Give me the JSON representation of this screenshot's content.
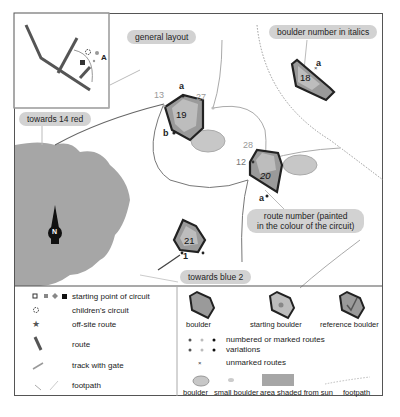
{
  "map": {
    "callouts": {
      "general_layout": "general layout",
      "boulder_number_italics": "boulder number in italics",
      "towards_14_red": "towards 14 red",
      "route_number": "route number (painted",
      "route_number_line2": "in the colour of the circuit)",
      "towards_blue_2": "towards blue 2"
    },
    "inset": {
      "letter": "A"
    },
    "route_numbers": {
      "r13": "13",
      "r27": "27",
      "r28": "28",
      "r12": "12",
      "r1": "1"
    },
    "route_letters": {
      "a19": "a",
      "b19": "b",
      "a20": "a",
      "a18": "a"
    },
    "boulders": [
      {
        "number": "19"
      },
      {
        "number": "20"
      },
      {
        "number": "21"
      },
      {
        "number": "18"
      }
    ],
    "north": "N",
    "colors": {
      "shade": "#a6a6a6",
      "boulder_dark": "#555555",
      "boulder_mid": "#9a9a9a",
      "path": "#888888",
      "footpath": "#aaaaaa"
    }
  },
  "legend": {
    "left": [
      {
        "icon": "starting-point-icons",
        "label": "starting point of circuit"
      },
      {
        "icon": "childrens-circuit-icon",
        "label": "children's circuit"
      },
      {
        "icon": "star-icon",
        "label": "off-site route"
      },
      {
        "icon": "route-line-icon",
        "label": "route"
      },
      {
        "icon": "track-gate-icon",
        "label": "track with gate"
      },
      {
        "icon": "footpath-icon",
        "label": "footpath"
      }
    ],
    "right": {
      "boulder_types": [
        "boulder",
        "starting boulder",
        "reference boulder"
      ],
      "routes": [
        {
          "label": "numbered or marked routes"
        },
        {
          "label": "variations"
        },
        {
          "label": "unmarked routes"
        }
      ],
      "features": [
        "boulder",
        "small boulder",
        "area shaded from sun",
        "footpath"
      ]
    }
  }
}
